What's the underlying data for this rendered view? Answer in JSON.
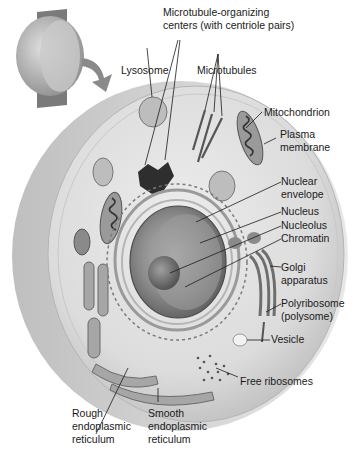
{
  "diagram": {
    "type": "labeled-illustration",
    "labels": {
      "mtoc_line1": "Microtubule-organizing",
      "mtoc_line2": "centers (with centriole pairs)",
      "lysosome": "Lysosome",
      "microtubules": "Microtubules",
      "mitochondrion": "Mitochondrion",
      "plasma_membrane_line1": "Plasma",
      "plasma_membrane_line2": "membrane",
      "nuclear_envelope_line1": "Nuclear",
      "nuclear_envelope_line2": "envelope",
      "nucleus": "Nucleus",
      "nucleolus": "Nucleolus",
      "chromatin": "Chromatin",
      "golgi_line1": "Golgi",
      "golgi_line2": "apparatus",
      "polyribosome_line1": "Polyribosome",
      "polyribosome_line2": "(polysome)",
      "vesicle": "Vesicle",
      "free_ribosomes": "Free ribosomes",
      "rough_er_line1": "Rough",
      "rough_er_line2": "endoplasmic",
      "rough_er_line3": "reticulum",
      "smooth_er_line1": "Smooth",
      "smooth_er_line2": "endoplasmic",
      "smooth_er_line3": "reticulum"
    },
    "colors": {
      "cell_outer": "#d9d9d9",
      "cytoplasm": "#e6e6e6",
      "organelle": "#8c8c8c",
      "dark": "#2b2b2b",
      "text": "#1a1a1a"
    }
  }
}
